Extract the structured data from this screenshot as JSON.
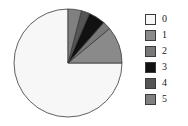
{
  "chart_data": {
    "type": "pie",
    "title": "",
    "labels": [
      "0",
      "1",
      "2",
      "3",
      "4",
      "5"
    ],
    "values": [
      75.0,
      11.0,
      2.5,
      5.0,
      2.5,
      4.0
    ],
    "units": "percent",
    "colors": [
      "#f7f7f7",
      "#8a8a8a",
      "#787878",
      "#111111",
      "#555555",
      "#808080"
    ],
    "edge_color": "#3a3a3a",
    "start_angle": 0,
    "direction": "counterclockwise",
    "legend_position": "right",
    "grid": false,
    "background": "#ffffff"
  },
  "legend": {
    "entries": [
      {
        "label": "0",
        "color": "#f7f7f7"
      },
      {
        "label": "1",
        "color": "#8a8a8a"
      },
      {
        "label": "2",
        "color": "#787878"
      },
      {
        "label": "3",
        "color": "#111111"
      },
      {
        "label": "4",
        "color": "#555555"
      },
      {
        "label": "5",
        "color": "#808080"
      }
    ]
  }
}
